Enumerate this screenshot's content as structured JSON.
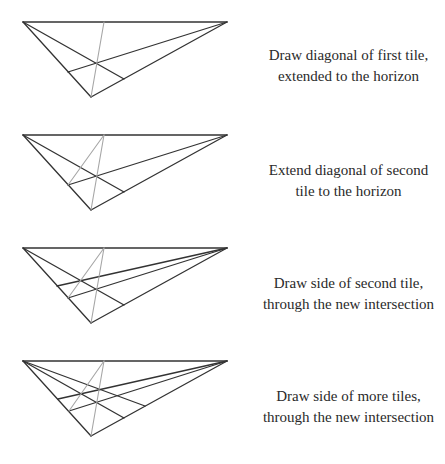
{
  "colors": {
    "line": "#333333",
    "diagonal": "#a6a6a6",
    "text": "#2a2a2a"
  },
  "steps": [
    {
      "line1": "Draw diagonal of first tile,",
      "line2": "extended to the horizon"
    },
    {
      "line1": "Extend diagonal of second",
      "line2": "tile to the horizon"
    },
    {
      "line1": "Draw side of second tile,",
      "line2": "through the new intersection"
    },
    {
      "line1": "Draw side of more tiles,",
      "line2": "through the new intersection"
    }
  ]
}
